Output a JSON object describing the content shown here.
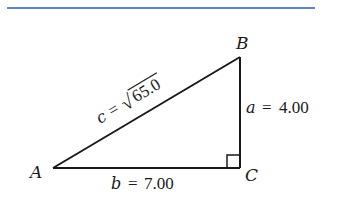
{
  "figure": {
    "rule_color": "#5b86c9",
    "line_color": "#1a1a1a",
    "vertices": {
      "A": {
        "label": "A"
      },
      "B": {
        "label": "B"
      },
      "C": {
        "label": "C"
      }
    },
    "sides": {
      "a": {
        "var": "a",
        "eq": "=",
        "value": "4.00"
      },
      "b": {
        "var": "b",
        "eq": "=",
        "value": "7.00"
      },
      "c": {
        "var": "c",
        "eq": "=",
        "radical": "√",
        "radicand": "65.0"
      }
    },
    "right_angle_at": "C"
  }
}
